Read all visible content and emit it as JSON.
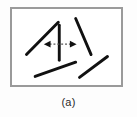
{
  "figure": {
    "caption": "(a)",
    "panel_label": "(a)",
    "frame": {
      "border_color": "#9a9a9a",
      "border_width_px": 2,
      "background": "#ffffff",
      "x": 10,
      "y": 7,
      "width": 113,
      "height": 80
    },
    "background_color": "#fdfdfd",
    "stroke_color": "#111111"
  },
  "chart_data": {
    "type": "diagram",
    "title": "(a)",
    "coordinate_space": {
      "width": 113,
      "height": 80,
      "units": "px"
    },
    "segments": [
      {
        "name": "upper-left-diagonal",
        "orientation_deg": 45,
        "x1": 15,
        "y1": 48,
        "x2": 48,
        "y2": 14,
        "stroke": "#111111",
        "stroke_width": 3
      },
      {
        "name": "center-vertical",
        "orientation_deg": 90,
        "x1": 49,
        "y1": 17,
        "x2": 49,
        "y2": 54,
        "stroke": "#111111",
        "stroke_width": 3
      },
      {
        "name": "upper-right-diagonal",
        "orientation_deg": 135,
        "x1": 66,
        "y1": 10,
        "x2": 82,
        "y2": 48,
        "stroke": "#111111",
        "stroke_width": 3
      },
      {
        "name": "lower-left-diagonal",
        "orientation_deg": 20,
        "x1": 24,
        "y1": 71,
        "x2": 66,
        "y2": 56,
        "stroke": "#111111",
        "stroke_width": 3
      },
      {
        "name": "lower-right-diagonal",
        "orientation_deg": 35,
        "x1": 70,
        "y1": 72,
        "x2": 99,
        "y2": 50,
        "stroke": "#111111",
        "stroke_width": 3
      }
    ],
    "annotation_arrow": {
      "name": "horizontal-double-headed-arrow",
      "style": "dashed",
      "x1": 34,
      "y1": 37,
      "x2": 66,
      "y2": 37,
      "stroke": "#555555",
      "stroke_width": 1,
      "dash_pattern": "2 2",
      "head_left": true,
      "head_right": true,
      "head_size": 5,
      "head_fill": "#111111"
    },
    "grid": false,
    "legend": null
  }
}
